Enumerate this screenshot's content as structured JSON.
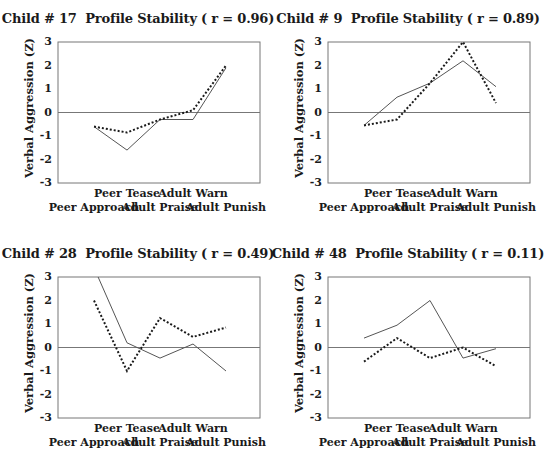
{
  "chart_data": [
    {
      "type": "line",
      "title": "Child # 17  Profile Stability ( r = 0.96)",
      "xlabel": "",
      "ylabel": "Verbal Aggression (Z)",
      "categories": [
        "Peer Approach",
        "Peer Tease",
        "Adult Praise",
        "Adult Warn",
        "Adult Punish"
      ],
      "ylim": [
        -3,
        3
      ],
      "yticks": [
        "3",
        "2",
        "1",
        "0",
        "-1",
        "-2",
        "-3"
      ],
      "grid": false,
      "legend": "none",
      "series": [
        {
          "name": "solid",
          "style": "solid",
          "values": [
            -0.6,
            -1.6,
            -0.3,
            -0.3,
            1.9
          ]
        },
        {
          "name": "dotted",
          "style": "dotted",
          "values": [
            -0.6,
            -0.85,
            -0.3,
            0.1,
            2.0
          ]
        }
      ]
    },
    {
      "type": "line",
      "title": "Child # 9  Profile Stability ( r = 0.89)",
      "xlabel": "",
      "ylabel": "Verbal Aggression (Z)",
      "categories": [
        "Peer Approach",
        "Peer Tease",
        "Adult Praise",
        "Adult Warn",
        "Adult Punish"
      ],
      "ylim": [
        -3,
        3
      ],
      "yticks": [
        "3",
        "2",
        "1",
        "0",
        "-1",
        "-2",
        "-3"
      ],
      "grid": false,
      "legend": "none",
      "series": [
        {
          "name": "solid",
          "style": "solid",
          "values": [
            -0.55,
            0.65,
            1.25,
            2.2,
            1.1
          ]
        },
        {
          "name": "dotted",
          "style": "dotted",
          "values": [
            -0.55,
            -0.3,
            1.25,
            3.0,
            0.4
          ]
        }
      ]
    },
    {
      "type": "line",
      "title": "Child # 28  Profile Stability ( r = 0.49)",
      "xlabel": "",
      "ylabel": "Verbal Aggression (Z)",
      "categories": [
        "Peer Approach",
        "Peer Tease",
        "Adult Praise",
        "Adult Warn",
        "Adult Punish"
      ],
      "ylim": [
        -3,
        3
      ],
      "yticks": [
        "3",
        "2",
        "1",
        "0",
        "-1",
        "-2",
        "-3"
      ],
      "grid": false,
      "legend": "none",
      "series": [
        {
          "name": "solid",
          "style": "solid",
          "values": [
            3.4,
            0.2,
            -0.45,
            0.15,
            -1.0
          ]
        },
        {
          "name": "dotted",
          "style": "dotted",
          "values": [
            2.0,
            -1.0,
            1.25,
            0.45,
            0.85
          ]
        }
      ]
    },
    {
      "type": "line",
      "title": "Child # 48  Profile Stability ( r = 0.11)",
      "xlabel": "",
      "ylabel": "Verbal Aggression (Z)",
      "categories": [
        "Peer Approach",
        "Peer Tease",
        "Adult Praise",
        "Adult Warn",
        "Adult Punish"
      ],
      "ylim": [
        -3,
        3
      ],
      "yticks": [
        "3",
        "2",
        "1",
        "0",
        "-1",
        "-2",
        "-3"
      ],
      "grid": false,
      "legend": "none",
      "series": [
        {
          "name": "solid",
          "style": "solid",
          "values": [
            0.4,
            0.95,
            2.0,
            -0.45,
            -0.05
          ]
        },
        {
          "name": "dotted",
          "style": "dotted",
          "values": [
            -0.6,
            0.4,
            -0.45,
            0.0,
            -0.8
          ]
        }
      ]
    }
  ],
  "colors": {
    "frame": "#777777",
    "solid_line": "#555555",
    "dotted_line": "#1a1a1a",
    "text": "#1a1a1a"
  }
}
